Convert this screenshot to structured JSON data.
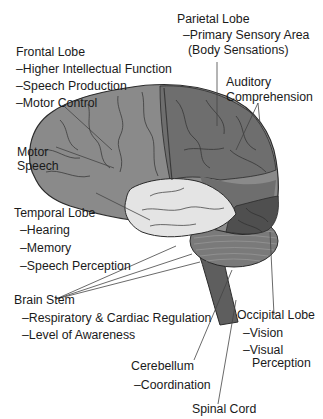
{
  "labels": {
    "frontal": {
      "name": "Frontal Lobe",
      "functions": [
        "–Higher Intellectual Function",
        "–Speech Production",
        "–Motor Control"
      ]
    },
    "parietal": {
      "name": "Parietal Lobe",
      "functions": [
        "–Primary Sensory Area",
        "(Body Sensations)"
      ]
    },
    "auditory": {
      "line1": "Auditory",
      "line2": "Comprehension"
    },
    "motor_speech": {
      "line1": "Motor",
      "line2": "Speech"
    },
    "temporal": {
      "name": "Temporal Lobe",
      "functions": [
        "–Hearing",
        "–Memory",
        "–Speech Perception"
      ]
    },
    "brain_stem": {
      "name": "Brain Stem",
      "functions": [
        "–Respiratory & Cardiac Regulation",
        "–Level of Awareness"
      ]
    },
    "occipital": {
      "name": "Occipital Lobe",
      "functions": [
        "–Vision",
        "–Visual",
        "Perception"
      ]
    },
    "cerebellum": {
      "name": "Cerebellum",
      "functions": [
        "–Coordination"
      ]
    },
    "spinal_cord": {
      "name": "Spinal Cord"
    }
  },
  "colors": {
    "frontal": "#8a8a8a",
    "parietal": "#6e6e6e",
    "temporal": "#e4e4e4",
    "occipital": "#4f4f4f",
    "cerebellum": "#7a7a7a",
    "brainstem": "#5e5e5e",
    "outline": "#2b2b2b",
    "leader": "#444444"
  }
}
